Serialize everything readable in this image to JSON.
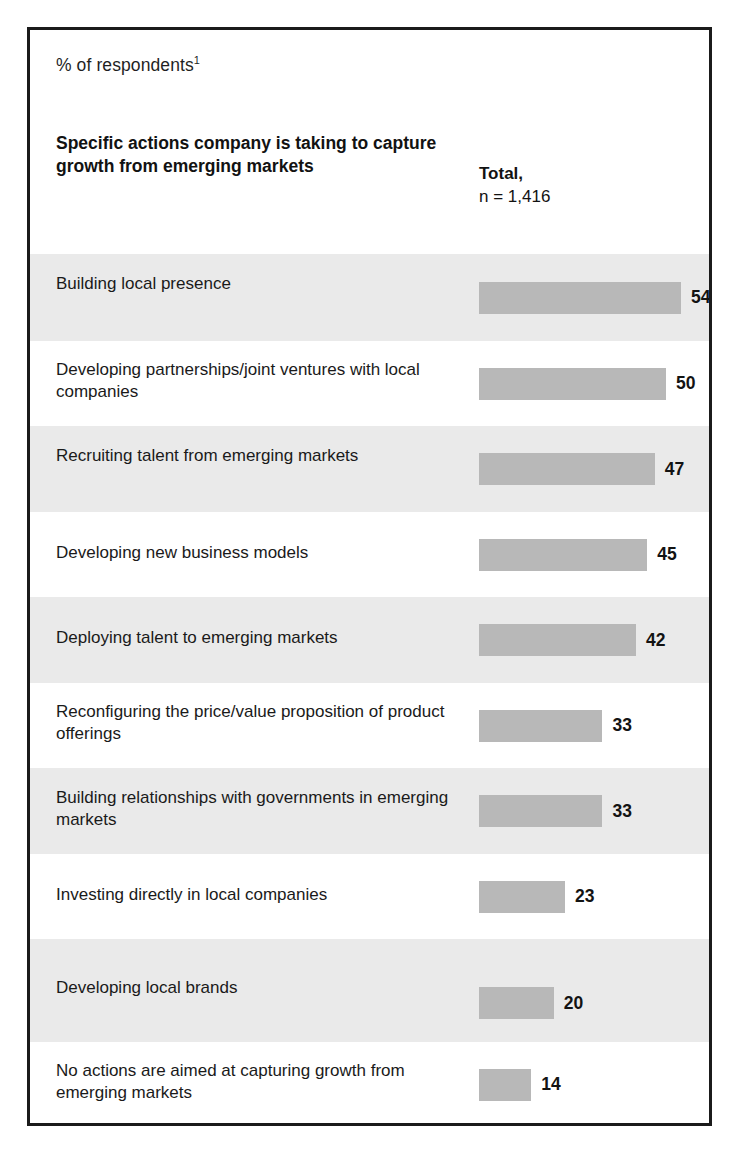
{
  "exhibit": {
    "units_label": "% of respondents",
    "units_footnote_marker": "1",
    "question_title": "Specific actions company is taking to capture growth from emerging markets",
    "column_header": {
      "label": "Total,",
      "n": "n = 1,416"
    },
    "colors": {
      "frame": "#1b1b1b",
      "band": "#eaeaea",
      "bar": "#b8b8b8",
      "text": "#1a1a1a",
      "page": "#ffffff"
    }
  },
  "chart_data": {
    "type": "bar",
    "orientation": "horizontal",
    "title": "Specific actions company is taking to capture growth from emerging markets",
    "subtitle": "% of respondents",
    "xlabel": "",
    "ylabel": "",
    "xlim": [
      0,
      60
    ],
    "grid": false,
    "legend": false,
    "value_suffix": "",
    "series_name": "Total, n = 1,416",
    "sample_size": 1416,
    "categories": [
      "Building local presence",
      "Developing partnerships/joint ventures with local companies",
      "Recruiting talent from emerging markets",
      "Developing new business models",
      "Deploying talent to emerging markets",
      "Reconfiguring the price/value proposition of product offerings",
      "Building relationships with governments in emerging markets",
      "Investing directly in local companies",
      "Developing local brands",
      "No actions are aimed at capturing growth from emerging markets"
    ],
    "values": [
      54,
      50,
      47,
      45,
      42,
      33,
      33,
      23,
      20,
      14
    ]
  },
  "rows": [
    {
      "label": "Building local presence",
      "value": 54,
      "value_text": "54",
      "shaded": true,
      "height": 87,
      "label_top": 19
    },
    {
      "label": "Developing partnerships/joint ventures with local companies",
      "value": 50,
      "value_text": "50",
      "shaded": false,
      "height": 85,
      "label_top": 18
    },
    {
      "label": "Recruiting talent from emerging markets",
      "value": 47,
      "value_text": "47",
      "shaded": true,
      "height": 86,
      "label_top": 19
    },
    {
      "label": "Developing new business models",
      "value": 45,
      "value_text": "45",
      "shaded": false,
      "height": 85,
      "label_top": 30
    },
    {
      "label": "Deploying talent to emerging markets",
      "value": 42,
      "value_text": "42",
      "shaded": true,
      "height": 86,
      "label_top": 30
    },
    {
      "label": "Reconfiguring the price/value proposition of product offerings",
      "value": 33,
      "value_text": "33",
      "shaded": false,
      "height": 85,
      "label_top": 18
    },
    {
      "label": "Building relationships with governments in emerging markets",
      "value": 33,
      "value_text": "33",
      "shaded": true,
      "height": 86,
      "label_top": 19
    },
    {
      "label": "Investing directly in local companies",
      "value": 23,
      "value_text": "23",
      "shaded": false,
      "height": 85,
      "label_top": 30
    },
    {
      "label": "Developing local brands",
      "value": 20,
      "value_text": "20",
      "shaded": true,
      "height": 103,
      "label_top": 38
    },
    {
      "label": "No actions are aimed at capturing growth from emerging markets",
      "value": 14,
      "value_text": "14",
      "shaded": false,
      "height": 85,
      "label_top": 18
    }
  ]
}
